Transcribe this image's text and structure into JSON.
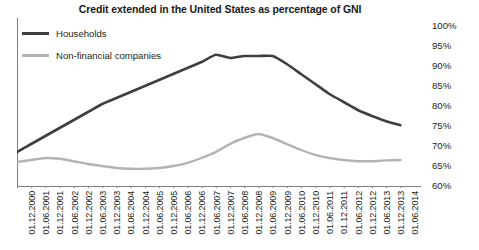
{
  "chart_data": {
    "type": "line",
    "title": "Credit extended in the United States as percentage of GNI",
    "xlabel": "",
    "ylabel": "",
    "ylim": [
      60,
      100
    ],
    "ytick_step": 5,
    "ytick_labels": [
      "100%",
      "95%",
      "90%",
      "85%",
      "80%",
      "75%",
      "70%",
      "65%",
      "60%"
    ],
    "ytick_values": [
      100,
      95,
      90,
      85,
      80,
      75,
      70,
      65,
      60
    ],
    "grid": false,
    "legend_position": "top-left",
    "categories": [
      "01.12.2000",
      "01.06.2001",
      "01.12.2001",
      "01.06.2002",
      "01.12.2002",
      "01.06.2003",
      "01.12.2003",
      "01.06.2004",
      "01.12.2004",
      "01.06.2005",
      "01.12.2005",
      "01.06.2006",
      "01.12.2006",
      "01.06.2007",
      "01.12.2007",
      "01.06.2008",
      "01.12.2008",
      "01.06.2009",
      "01.12.2009",
      "01.06.2010",
      "01.12.2010",
      "01.06.2011",
      "01.12.2011",
      "01.06.2012",
      "01.12.2012",
      "01.06.2013",
      "01.12.2013",
      "01.06.2014"
    ],
    "series": [
      {
        "name": "Households",
        "color": "#3f3f3f",
        "values": [
          68.5,
          70.5,
          72.5,
          74.5,
          76.5,
          78.5,
          80.5,
          82.0,
          83.5,
          85.0,
          86.5,
          88.0,
          89.5,
          91.0,
          92.8,
          92.0,
          92.5,
          92.5,
          92.5,
          90.5,
          88.0,
          85.5,
          83.0,
          81.0,
          79.0,
          77.5,
          76.2,
          75.2
        ]
      },
      {
        "name": "Non-financial companies",
        "color": "#b3b3b3",
        "values": [
          66.0,
          66.5,
          67.0,
          66.8,
          66.2,
          65.5,
          65.0,
          64.5,
          64.3,
          64.3,
          64.5,
          65.0,
          65.8,
          67.0,
          68.5,
          70.5,
          72.0,
          73.0,
          72.0,
          70.5,
          69.0,
          67.8,
          67.0,
          66.5,
          66.2,
          66.2,
          66.4,
          66.5
        ]
      }
    ]
  },
  "legend": {
    "items": [
      {
        "label": "Households",
        "color": "#3f3f3f"
      },
      {
        "label": "Non-financial companies",
        "color": "#b3b3b3"
      }
    ]
  },
  "colors": {
    "households": "#3f3f3f",
    "non_financial": "#b3b3b3",
    "axis": "#808080",
    "text": "#231f20",
    "background": "#ffffff"
  }
}
